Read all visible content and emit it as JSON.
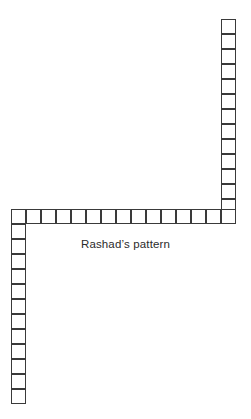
{
  "figure": {
    "name": "rashads-pattern",
    "caption": "Rashad’s pattern",
    "background_color": "#ffffff",
    "stroke_color": "#3a3a3a",
    "cell_fill_color": "#ffffff",
    "canvas": {
      "width": 251,
      "height": 419
    }
  },
  "grid": {
    "cell_size": 15,
    "stroke_width": 1,
    "origin_x": 11,
    "corner_y": 209,
    "right_column_x": 221,
    "bottom_y": 404,
    "right_x": 236,
    "top_y": 19
  },
  "chart_data": {
    "type": "diagram",
    "title": "Rashad’s pattern",
    "cell_size": 15,
    "units": "squares",
    "segments": [
      {
        "name": "top-right-vertical-column",
        "orientation": "vertical",
        "count": 13,
        "x": 221,
        "y_start": 19,
        "direction": "down"
      },
      {
        "name": "middle-horizontal-row",
        "orientation": "horizontal",
        "count": 15,
        "x_start": 11,
        "y": 209,
        "direction": "right"
      },
      {
        "name": "bottom-left-vertical-column",
        "orientation": "vertical",
        "count": 12,
        "x": 11,
        "y_start": 224,
        "direction": "down"
      }
    ],
    "total_squares": 40,
    "legend": [],
    "grid": false,
    "xlabel": "",
    "ylabel": ""
  }
}
